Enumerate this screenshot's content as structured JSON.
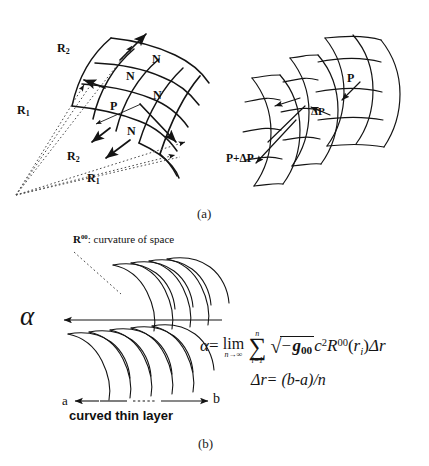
{
  "figure": {
    "panels": [
      {
        "id": "a",
        "caption": "(a)",
        "left_diagram": {
          "name": "curved-surface-with-normals",
          "labels": {
            "r2_top": "R",
            "r2_top_sub": "2",
            "r1_left": "R",
            "r1_left_sub": "1",
            "r2_lower": "R",
            "r2_lower_sub": "2",
            "r1_bottom": "R",
            "r1_bottom_sub": "1",
            "p": "P",
            "n1": "N",
            "n2": "N",
            "n3": "N",
            "n4": "N"
          }
        },
        "right_diagram": {
          "name": "curved-surface-pressure-difference",
          "labels": {
            "p": "P",
            "delta_p": "ΔP",
            "p_plus_delta_p": "P+ΔP"
          }
        }
      },
      {
        "id": "b",
        "caption": "(b)",
        "annotation": {
          "symbol": "R",
          "symbol_sup": "00",
          "text": ": curvature of space"
        },
        "alpha_symbol": "α",
        "axis": {
          "start_label": "a",
          "end_label": "b",
          "axis_caption": "curved thin layer"
        },
        "equations": {
          "main": {
            "lhs": "α",
            "equals": "=",
            "lim": "lim",
            "lim_sub": "n→∞",
            "sum_glyph": "∑",
            "sum_upper": "n",
            "sum_lower": "i=1",
            "radicand_sign": "−",
            "g": "g",
            "g_sub": "00",
            "c": "c",
            "c_sup": "2",
            "R": "R",
            "R_sup": "00",
            "arg_open": "(",
            "arg_r": "r",
            "arg_r_sub": "i",
            "arg_close": ")",
            "delta_r": "Δr"
          },
          "second": "Δr= (b-a)/n"
        }
      }
    ]
  },
  "style": {
    "ink": "#141414",
    "background": "#ffffff"
  }
}
